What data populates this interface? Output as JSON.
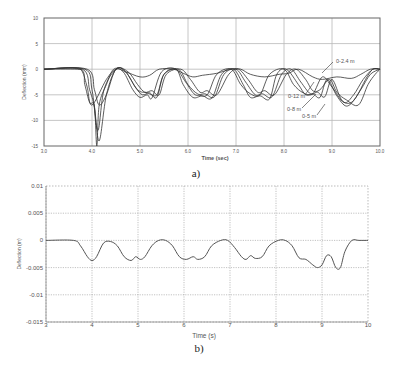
{
  "figure": {
    "panel_a_caption": "a)",
    "panel_b_caption": "b)"
  },
  "chart_data": [
    {
      "type": "line",
      "panel": "a",
      "title": "",
      "xlabel": "Time (sec)",
      "ylabel": "Deflection (mm)",
      "xlim": [
        3.0,
        10.0
      ],
      "ylim": [
        -15,
        10
      ],
      "xticks": [
        "3.0",
        "4.0",
        "5.0",
        "6.0",
        "7.0",
        "8.0",
        "9.0",
        "10.0"
      ],
      "yticks": [
        "10",
        "5",
        "0",
        "-5",
        "-10",
        "-15"
      ],
      "grid": true,
      "annotations": [
        "0-2.4 m",
        "0-12 m",
        "0-8 m",
        "0-5 m"
      ],
      "series": [
        {
          "name": "0-2.4 m",
          "x": [
            3.0,
            3.7,
            3.8,
            3.9,
            4.0,
            4.3,
            4.5,
            4.7,
            5.0,
            5.2,
            5.4,
            5.7,
            5.9,
            6.1,
            6.3,
            6.6,
            6.9,
            7.1,
            7.3,
            7.6,
            7.9,
            8.1,
            8.3,
            8.6,
            8.8,
            9.1,
            9.4,
            9.6,
            9.8,
            10.0
          ],
          "y": [
            0,
            0,
            -0.5,
            -3.5,
            -7,
            -2,
            0,
            -0.5,
            -1.5,
            -1.2,
            0,
            0,
            -0.8,
            -1.5,
            -1.2,
            -0.8,
            0,
            0,
            -1,
            -1.5,
            -1,
            -0.8,
            0,
            -1.5,
            -2,
            -1.5,
            -1.8,
            -1,
            0,
            0
          ]
        },
        {
          "name": "0-5 m",
          "x": [
            3.0,
            3.75,
            3.85,
            3.95,
            4.05,
            4.1,
            4.15,
            4.3,
            4.45,
            4.65,
            4.85,
            5.0,
            5.15,
            5.25,
            5.45,
            5.75,
            5.9,
            6.1,
            6.3,
            6.5,
            6.7,
            6.95,
            7.15,
            7.3,
            7.5,
            7.7,
            7.85,
            8.05,
            8.3,
            8.45,
            8.6,
            8.75,
            8.9,
            9.1,
            9.3,
            9.5,
            9.7,
            9.85,
            10.0
          ],
          "y": [
            0,
            0,
            -3,
            -6.5,
            -7.2,
            -15,
            -7,
            -3,
            0,
            -0.5,
            -4,
            -5.5,
            -5,
            -5.6,
            -0.5,
            0,
            -3,
            -5.5,
            -5.2,
            -5.6,
            -1,
            0,
            -3,
            -5.5,
            -5.2,
            -5.8,
            -1,
            0,
            -3,
            -5,
            -4.8,
            -5.5,
            -2,
            -5.2,
            -7.2,
            -5.5,
            -2,
            0,
            0
          ]
        },
        {
          "name": "0-8 m",
          "x": [
            3.0,
            3.8,
            3.95,
            4.05,
            4.15,
            4.3,
            4.5,
            4.7,
            4.9,
            5.05,
            5.2,
            5.35,
            5.5,
            5.75,
            5.95,
            6.15,
            6.35,
            6.55,
            6.75,
            7.0,
            7.2,
            7.4,
            7.55,
            7.75,
            7.95,
            8.15,
            8.35,
            8.55,
            8.7,
            8.85,
            9.0,
            9.2,
            9.4,
            9.6,
            9.8,
            10.0
          ],
          "y": [
            0,
            0,
            -4,
            -7.4,
            -14,
            -5,
            0,
            -0.5,
            -3.5,
            -5,
            -4.6,
            -5.5,
            -1,
            0,
            -2.5,
            -5,
            -4.8,
            -5.4,
            -1,
            0,
            -2.5,
            -5,
            -4.8,
            -5.4,
            -1,
            0,
            -2.5,
            -4.8,
            -4.5,
            -5.4,
            -2,
            -6,
            -6.5,
            -4,
            -1,
            0
          ]
        },
        {
          "name": "0-12 m",
          "x": [
            3.0,
            3.9,
            4.05,
            4.15,
            4.3,
            4.5,
            4.75,
            4.95,
            5.1,
            5.25,
            5.4,
            5.55,
            5.85,
            6.05,
            6.25,
            6.4,
            6.6,
            6.85,
            7.05,
            7.25,
            7.45,
            7.6,
            7.8,
            8.05,
            8.25,
            8.45,
            8.6,
            8.75,
            8.95,
            9.1,
            9.3,
            9.55,
            9.75,
            9.9,
            10.0
          ],
          "y": [
            0,
            0,
            -4,
            -7,
            -5,
            0,
            -0.5,
            -3,
            -4.5,
            -4.2,
            -5,
            -1,
            0,
            -2,
            -4.5,
            -4.2,
            -5,
            -1,
            0,
            -2,
            -4.5,
            -4.2,
            -5,
            -1,
            0,
            -2,
            -4.2,
            -4,
            -2,
            -4.5,
            -6,
            -7,
            -3,
            -1,
            0
          ]
        },
        {
          "name": "extra",
          "x": [
            3.0,
            3.85,
            4.0,
            4.12,
            4.25,
            4.5,
            4.7,
            4.95,
            5.15,
            5.35,
            5.5,
            5.8,
            6.0,
            6.2,
            6.4,
            6.6,
            6.9,
            7.1,
            7.3,
            7.5,
            7.7,
            8.0,
            8.2,
            8.4,
            8.6,
            8.8,
            9.0,
            9.25,
            9.45,
            9.65,
            9.85,
            10.0
          ],
          "y": [
            0,
            0,
            -4,
            -12,
            -4,
            0,
            -0.5,
            -4,
            -4.6,
            -5,
            -1,
            0,
            -3,
            -4.8,
            -5,
            -1,
            0,
            -3,
            -4.8,
            -5,
            -1,
            0,
            -3,
            -4.6,
            -4.8,
            -1.5,
            -3.5,
            -6.5,
            -5,
            -2,
            0,
            0
          ]
        }
      ]
    },
    {
      "type": "line",
      "panel": "b",
      "title": "",
      "xlabel": "Time (s)",
      "ylabel": "Deflection (m)",
      "xlim": [
        3,
        10
      ],
      "ylim": [
        -0.015,
        0.01
      ],
      "xticks": [
        "3",
        "4",
        "5",
        "6",
        "7",
        "8",
        "9",
        "10"
      ],
      "yticks": [
        "0.01",
        "0.005",
        "0",
        "-0.005",
        "-0.01",
        "-0.015"
      ],
      "grid": true,
      "series": [
        {
          "name": "deflection",
          "x": [
            3.0,
            3.6,
            3.75,
            3.9,
            4.0,
            4.1,
            4.25,
            4.4,
            4.55,
            4.7,
            4.85,
            4.95,
            5.05,
            5.15,
            5.3,
            5.45,
            5.6,
            5.75,
            5.9,
            6.05,
            6.2,
            6.3,
            6.45,
            6.6,
            6.8,
            6.95,
            7.1,
            7.25,
            7.35,
            7.45,
            7.55,
            7.7,
            7.85,
            8.05,
            8.2,
            8.35,
            8.5,
            8.65,
            8.8,
            8.9,
            9.0,
            9.1,
            9.2,
            9.3,
            9.4,
            9.5,
            9.65,
            9.8,
            10.0
          ],
          "y": [
            0,
            0,
            -0.001,
            -0.003,
            -0.0037,
            -0.003,
            -0.0005,
            -0.0002,
            -0.001,
            -0.003,
            -0.0037,
            -0.003,
            -0.0035,
            -0.003,
            -0.001,
            0,
            0,
            -0.001,
            -0.003,
            -0.0035,
            -0.003,
            -0.0035,
            -0.003,
            -0.001,
            0,
            0,
            -0.0013,
            -0.003,
            -0.0035,
            -0.0028,
            -0.0033,
            -0.003,
            -0.001,
            0,
            0,
            -0.001,
            -0.0032,
            -0.0035,
            -0.0045,
            -0.005,
            -0.0045,
            -0.0028,
            -0.003,
            -0.005,
            -0.005,
            -0.002,
            0,
            0,
            0
          ]
        }
      ]
    }
  ]
}
